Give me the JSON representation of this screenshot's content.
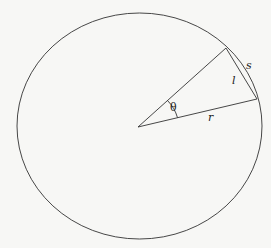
{
  "diagram": {
    "type": "circle-arc-chord",
    "labels": {
      "angle": "θ",
      "radius": "r",
      "chord": "l",
      "arc": "s"
    },
    "colors": {
      "stroke": "#333333",
      "background": "#f7f7f5"
    }
  }
}
